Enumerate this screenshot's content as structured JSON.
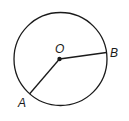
{
  "diagram": {
    "type": "circle-with-radii",
    "center": {
      "label": "O",
      "x": 59.5,
      "y": 59
    },
    "radius": 46.5,
    "points": [
      {
        "label": "A",
        "x": 29,
        "y": 94
      },
      {
        "label": "B",
        "x": 106,
        "y": 53
      }
    ],
    "segments": [
      {
        "from": "O",
        "to": "A"
      },
      {
        "from": "O",
        "to": "B"
      }
    ],
    "colors": {
      "stroke": "#1a1a1a",
      "background": "#ffffff"
    }
  }
}
